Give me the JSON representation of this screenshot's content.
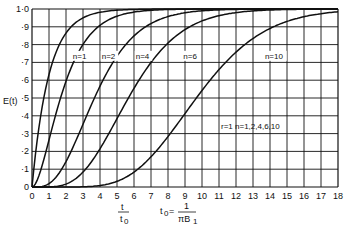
{
  "chart_data": {
    "type": "line",
    "title": "",
    "xlabel": "t / t0",
    "xlabel_note": "t0 = 1 / πB1",
    "ylabel": "E(t)",
    "xlim": [
      0,
      18
    ],
    "ylim": [
      0,
      1.0
    ],
    "grid": true,
    "x_ticks": [
      "0",
      "1",
      "2",
      "3",
      "4",
      "5",
      "6",
      "7",
      "8",
      "9",
      "10",
      "11",
      "12",
      "13",
      "14",
      "15",
      "16",
      "17",
      "18"
    ],
    "y_ticks": [
      "0",
      "·1",
      "·2",
      "·3",
      "·4",
      "·5",
      "·6",
      "·7",
      "·8",
      "·9",
      "1·0"
    ],
    "annotation": "r=1 n=1,2,4,6,10",
    "x": [
      0,
      1,
      2,
      3,
      4,
      5,
      6,
      7,
      8,
      9,
      10,
      11,
      12,
      13,
      14,
      15,
      16,
      17,
      18
    ],
    "series": [
      {
        "name": "n=1",
        "label_pos": [
          2.4,
          0.72
        ],
        "values": [
          0,
          0.632,
          0.865,
          0.95,
          0.982,
          0.993,
          0.998,
          0.999,
          1,
          1,
          1,
          1,
          1,
          1,
          1,
          1,
          1,
          1,
          1
        ]
      },
      {
        "name": "n=2",
        "label_pos": [
          4.1,
          0.72
        ],
        "values": [
          0,
          0.264,
          0.594,
          0.801,
          0.908,
          0.96,
          0.983,
          0.993,
          0.997,
          0.999,
          1,
          1,
          1,
          1,
          1,
          1,
          1,
          1,
          1
        ]
      },
      {
        "name": "n=4",
        "label_pos": [
          6.1,
          0.72
        ],
        "values": [
          0,
          0.019,
          0.143,
          0.353,
          0.567,
          0.735,
          0.849,
          0.918,
          0.958,
          0.979,
          0.99,
          0.995,
          0.998,
          0.999,
          1,
          1,
          1,
          1,
          1
        ]
      },
      {
        "name": "n=6",
        "label_pos": [
          8.9,
          0.72
        ],
        "values": [
          0,
          0.001,
          0.017,
          0.084,
          0.215,
          0.384,
          0.554,
          0.699,
          0.809,
          0.884,
          0.933,
          0.962,
          0.98,
          0.989,
          0.994,
          0.997,
          0.999,
          0.999,
          1
        ]
      },
      {
        "name": "n=10",
        "label_pos": [
          13.7,
          0.72
        ],
        "values": [
          0,
          0,
          0,
          0.001,
          0.008,
          0.032,
          0.084,
          0.17,
          0.283,
          0.413,
          0.542,
          0.659,
          0.758,
          0.834,
          0.891,
          0.93,
          0.957,
          0.974,
          0.985
        ]
      }
    ]
  },
  "labels": {
    "ylabel": "E(t)",
    "annotation": "r=1  n=1,2,4,6,10",
    "xlabel_num": "t",
    "xlabel_den": "t",
    "xlabel_den_sub": "0",
    "t0_lhs": "t",
    "t0_sub": "0",
    "t0_eq": " = ",
    "t0_num": "1",
    "t0_den": "πB",
    "t0_den_sub": "1"
  }
}
